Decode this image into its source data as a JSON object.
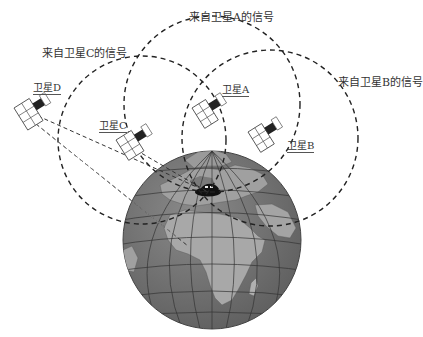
{
  "diagram": {
    "type": "gps-trilateration",
    "signal_labels": {
      "A": "来自卫星A的信号",
      "B": "来自卫星B的信号",
      "C": "来自卫星C的信号"
    },
    "satellites": [
      {
        "id": "A",
        "label": "卫星A"
      },
      {
        "id": "B",
        "label": "卫星B"
      },
      {
        "id": "C",
        "label": "卫星C"
      },
      {
        "id": "D",
        "label": "卫星D"
      }
    ],
    "earth": {
      "ocean_color": "#6e6e6e",
      "land_color": "#a9a9a9",
      "grid_color": "#3a3a3a"
    },
    "receiver": "car-on-earth",
    "line_color": "#222222"
  }
}
